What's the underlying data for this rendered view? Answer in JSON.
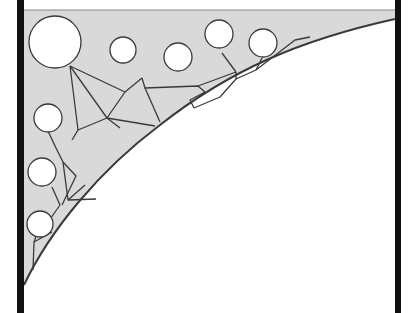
{
  "canvas": {
    "width": 418,
    "height": 313,
    "background": "#ffffff"
  },
  "colors": {
    "frame": "#111111",
    "shade": "#d9d9d9",
    "line": "#3a3a3a",
    "circle_fill": "#ffffff"
  },
  "frame": {
    "left_bar": {
      "x": 17,
      "y": 0,
      "w": 7,
      "h": 313
    },
    "right_bar": {
      "x": 395,
      "y": 0,
      "w": 6,
      "h": 313
    },
    "top_line_y": 10
  },
  "shaded_region": "M24,10 L395,10 L395,19 C300,40 230,70 160,125 C100,170 50,230 24,285 Z",
  "surface_arc": "M24,285 C50,230 100,170 160,125 C230,70 300,40 395,19",
  "network_paths": [
    "M70,66 L78,130",
    "M70,66 L125,92 L142,78",
    "M142,78 L145,88 L198,86 L205,92",
    "M125,92 L107,118 L78,130",
    "M107,118 L155,126",
    "M107,118 L120,128",
    "M70,66 L107,118",
    "M78,130 L72,140",
    "M205,92 L190,100 L194,108",
    "M145,88 L160,122",
    "M198,86 L236,72",
    "M236,72 L236,79 L256,70",
    "M236,72 L222,53",
    "M256,70 L262,58",
    "M256,70 L295,40 L310,37",
    "M194,108 L220,97 L236,79",
    "M48,131 L56,148 L63,162",
    "M63,162 L68,200 L85,185",
    "M63,162 L76,176 L62,205",
    "M68,200 L96,199",
    "M52,187 L60,205",
    "M60,205 L48,222",
    "M40,225 L34,242 L33,270",
    "M34,242 L52,232"
  ],
  "circles": [
    {
      "cx": 55,
      "cy": 42,
      "r": 26
    },
    {
      "cx": 123,
      "cy": 50,
      "r": 13
    },
    {
      "cx": 178,
      "cy": 57,
      "r": 14
    },
    {
      "cx": 219,
      "cy": 34,
      "r": 14
    },
    {
      "cx": 263,
      "cy": 43,
      "r": 14
    },
    {
      "cx": 48,
      "cy": 118,
      "r": 14
    },
    {
      "cx": 42,
      "cy": 172,
      "r": 14
    },
    {
      "cx": 40,
      "cy": 224,
      "r": 13
    }
  ]
}
